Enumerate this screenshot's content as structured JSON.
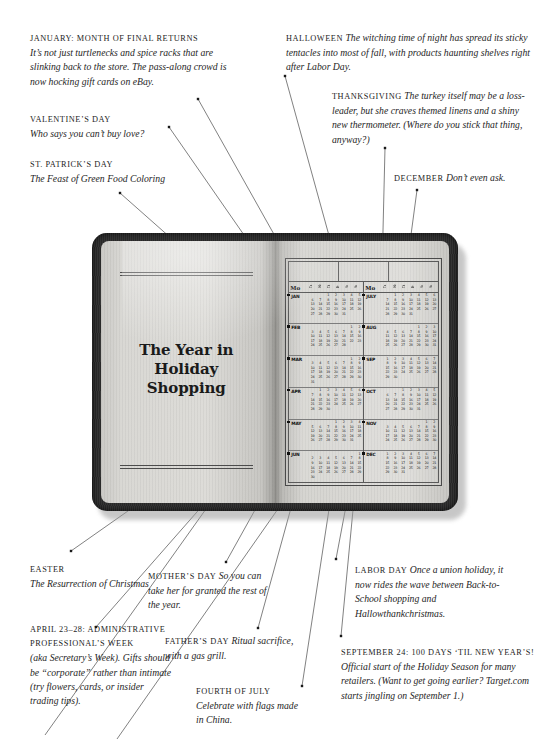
{
  "illustration": {
    "name": "open-datebook-with-year-calendar",
    "book_title_lines": [
      "The Year in",
      "Holiday",
      "Shopping"
    ],
    "calendar": {
      "weekday_headers": [
        "Mo",
        "Tu",
        "We",
        "Th",
        "Fr",
        "Sa",
        "Su"
      ],
      "left_column_months": [
        "JAN",
        "FEB",
        "MAR",
        "APR",
        "MAY",
        "JUN"
      ],
      "right_column_months": [
        "JULY",
        "AUG",
        "SEP",
        "OCT",
        "NOV",
        "DEC"
      ],
      "month_weeks": {
        "JAN": [
          "1 2 3 4 5",
          "6 7 8 9 10 11 12",
          "13 14 15 16 17 18 19",
          "20 21 22 23 24 25 26",
          "27 28 29 30 31"
        ],
        "FEB": [
          "1 2",
          "3 4 5 6 7 8 9",
          "10 11 12 13 14 15 16",
          "17 18 19 20 21 22 23",
          "24 25 26 27 28"
        ],
        "MAR": [
          "1 2",
          "3 4 5 6 7 8 9",
          "10 11 12 13 14 15 16",
          "17 18 19 20 21 22 23",
          "24 25 26 27 28 29 30",
          "31"
        ],
        "APR": [
          "1 2 3 4 5 6",
          "7 8 9 10 11 12 13",
          "14 15 16 17 18 19 20",
          "21 22 23 24 25 26 27",
          "28 29 30"
        ],
        "MAY": [
          "1 2 3 4",
          "5 6 7 8 9 10 11",
          "12 13 14 15 16 17 18",
          "19 20 21 22 23 24 25",
          "26 27 28 29 30 31"
        ],
        "JUN": [
          "1",
          "2 3 4 5 6 7 8",
          "9 10 11 12 13 14 15",
          "16 17 18 19 20 21 22",
          "23 24 25 26 27 28 29",
          "30"
        ],
        "JULY": [
          "1 2 3 4 5 6",
          "7 8 9 10 11 12 13",
          "14 15 16 17 18 19 20",
          "21 22 23 24 25 26 27",
          "28 29 30 31"
        ],
        "AUG": [
          "1 2 3",
          "4 5 6 7 8 9 10",
          "11 12 13 14 15 16 17",
          "18 19 20 21 22 23 24",
          "25 26 27 28 29 30 31"
        ],
        "SEP": [
          "1 2 3 4 5 6 7",
          "8 9 10 11 12 13 14",
          "15 16 17 18 19 20 21",
          "22 23 24 25 26 27 28",
          "29 30"
        ],
        "OCT": [
          "1 2 3 4 5",
          "6 7 8 9 10 11 12",
          "13 14 15 16 17 18 19",
          "20 21 22 23 24 25 26",
          "27 28 29 30 31"
        ],
        "NOV": [
          "1 2",
          "3 4 5 6 7 8 9",
          "10 11 12 13 14 15 16",
          "17 18 19 20 21 22 23",
          "24 25 26 27 28 29 30"
        ],
        "DEC": [
          "1 2 3 4 5 6 7",
          "8 9 10 11 12 13 14",
          "15 16 17 18 19 20 21",
          "22 23 24 25 26 27 28",
          "29 30 31"
        ]
      }
    }
  },
  "notes": {
    "january": {
      "heading": "January: Month of Final Returns",
      "body": "It’s not just turtlenecks and spice racks that are slinking back to the store. The pass-along crowd is now hocking gift cards on eBay."
    },
    "valentines": {
      "heading": "Valentine’s Day",
      "body": "Who says you can’t buy love?"
    },
    "stpatricks": {
      "heading": "St. Patrick’s Day",
      "body": "The Feast of Green Food Coloring"
    },
    "easter": {
      "heading": "Easter",
      "body": "The Resurrection of Christmas"
    },
    "administrative": {
      "heading": "April 23–28: Administrative Professional’s Week",
      "body": "(aka Secretary’s Week). Gifts should be “corporate” rather than intimate (try flowers, cards, or insider trading tips)."
    },
    "mothers": {
      "heading": "Mother’s Day",
      "body": "So you can take her for granted the rest of the year."
    },
    "fathers": {
      "heading": "Father’s Day",
      "body": "Ritual sacrifice, with a gas grill."
    },
    "fourthofjuly": {
      "heading": "Fourth of July",
      "body": "Celebrate with flags made in China."
    },
    "labor": {
      "heading": "Labor Day",
      "body": "Once a union holiday, it now rides the wave between Back-to-School shopping and Hallowthankchristmas."
    },
    "september24": {
      "heading": "September 24: 100 Days ‘til New Year’s!",
      "body": "Official start of the Holiday Season for many retailers. (Want to get going earlier? Target.com starts jingling on September 1.)"
    },
    "halloween": {
      "heading": "Halloween",
      "body": "The witching time of night has spread its sticky tentacles into most of fall, with products haunting shelves right after Labor Day."
    },
    "thanksgiving": {
      "heading": "Thanksgiving",
      "body": "The turkey itself may be a loss-leader, but she craves themed linens and a shiny new thermometer. (Where do you stick that thing, anyway?)"
    },
    "december": {
      "heading": "December",
      "body": "Don’t even ask."
    }
  },
  "colors": {
    "background": "#ffffff",
    "text": "#262626",
    "leader_line": "#4a4a4a",
    "book_cover": "#2b2b2b",
    "book_page": "#d8d7d3"
  }
}
